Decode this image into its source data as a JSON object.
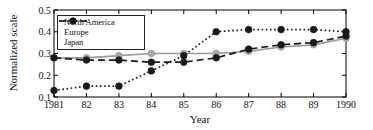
{
  "chart_data": {
    "type": "line",
    "title": "",
    "xlabel": "Year",
    "ylabel": "Normalized scale",
    "x": [
      1981,
      1982,
      1983,
      1984,
      1985,
      1986,
      1987,
      1988,
      1989,
      1990
    ],
    "x_tick_labels": [
      "1981",
      "82",
      "83",
      "84",
      "85",
      "86",
      "87",
      "88",
      "89",
      "1990"
    ],
    "y_ticks": [
      0.1,
      0.2,
      0.3,
      0.4,
      0.5
    ],
    "y_tick_labels": [
      "0.1",
      "0.2",
      "0.3",
      "0.4",
      "0.5"
    ],
    "ylim": [
      0.1,
      0.5
    ],
    "grid": false,
    "legend_position": "top-left",
    "axis_color": "#000000",
    "background": "#ffffff",
    "series": [
      {
        "name": "North America",
        "style": "solid",
        "line_color": "#9b9b9b",
        "marker_color": "#a8a8a8",
        "values": [
          0.28,
          0.28,
          0.29,
          0.3,
          0.3,
          0.3,
          0.31,
          0.33,
          0.34,
          0.37
        ]
      },
      {
        "name": "Europe",
        "style": "dashed",
        "line_color": "#1a1a1a",
        "marker_color": "#1a1a1a",
        "values": [
          0.28,
          0.27,
          0.27,
          0.26,
          0.26,
          0.28,
          0.32,
          0.34,
          0.35,
          0.38
        ]
      },
      {
        "name": "Japan",
        "style": "dotted",
        "line_color": "#1a1a1a",
        "marker_color": "#1a1a1a",
        "values": [
          0.13,
          0.15,
          0.15,
          0.22,
          0.29,
          0.4,
          0.41,
          0.41,
          0.41,
          0.4
        ]
      }
    ]
  }
}
